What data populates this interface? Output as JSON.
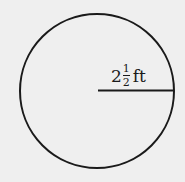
{
  "diagram": {
    "shape": "circle",
    "radius_label": {
      "whole": "2",
      "numerator": "1",
      "denominator": "2",
      "unit": "ft"
    },
    "colors": {
      "stroke": "#1a1a1a",
      "background": "#efefef"
    }
  }
}
